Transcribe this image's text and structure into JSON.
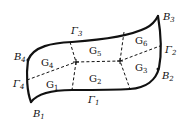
{
  "diagram": {
    "corners": [
      {
        "id": "B1",
        "base": "B",
        "sub": "1"
      },
      {
        "id": "B2",
        "base": "B",
        "sub": "2"
      },
      {
        "id": "B3",
        "base": "B",
        "sub": "3"
      },
      {
        "id": "B4",
        "base": "B",
        "sub": "4"
      }
    ],
    "boundaries": [
      {
        "id": "Gamma1",
        "base": "Γ",
        "sub": "1"
      },
      {
        "id": "Gamma2",
        "base": "Γ",
        "sub": "2"
      },
      {
        "id": "Gamma3",
        "base": "Γ",
        "sub": "3"
      },
      {
        "id": "Gamma4",
        "base": "Γ",
        "sub": "4"
      }
    ],
    "subdomains": [
      {
        "id": "G1",
        "base": "G",
        "sub": "1"
      },
      {
        "id": "G2",
        "base": "G",
        "sub": "2"
      },
      {
        "id": "G3",
        "base": "G",
        "sub": "3"
      },
      {
        "id": "G4",
        "base": "G",
        "sub": "4"
      },
      {
        "id": "G5",
        "base": "G",
        "sub": "5"
      },
      {
        "id": "G6",
        "base": "G",
        "sub": "6"
      }
    ],
    "colors": {
      "stroke": "#111111",
      "background": "#ffffff"
    }
  }
}
